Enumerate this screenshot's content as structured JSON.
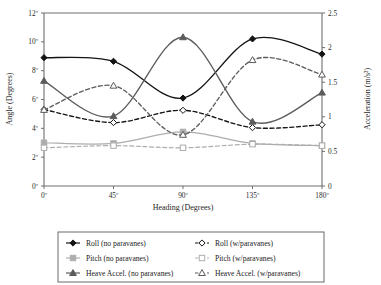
{
  "chart_data": {
    "type": "line",
    "title": "",
    "xlabel": "Heading (Degrees)",
    "ylabel": "Angle (Degrees)",
    "y2label": "Acceleration (m/s²)",
    "x": [
      0,
      45,
      90,
      135,
      180
    ],
    "xtick_labels": [
      "0º",
      "45º",
      "90º",
      "135º",
      "180º"
    ],
    "xlim": [
      0,
      180
    ],
    "ylim": [
      0,
      12
    ],
    "ytick_values": [
      0,
      2,
      4,
      6,
      8,
      10,
      12
    ],
    "ytick_labels": [
      "0º",
      "2º",
      "4º",
      "6º",
      "8º",
      "10º",
      "12º"
    ],
    "y2lim": [
      0,
      2.5
    ],
    "y2tick_values": [
      0,
      0.5,
      1,
      1.5,
      2,
      2.5
    ],
    "y2tick_labels": [
      "0",
      "0.5",
      "1",
      "1.5",
      "2",
      "2.5"
    ],
    "grid": false,
    "legend_position": "below-plot",
    "series": [
      {
        "name": "Roll (no paravanes)",
        "axis": "left",
        "units": "degrees",
        "marker": "filled-diamond",
        "line_style": "solid",
        "color": "#141414",
        "values": [
          8.9,
          8.65,
          6.1,
          10.2,
          9.15
        ]
      },
      {
        "name": "Roll (w/paravanes)",
        "axis": "left",
        "units": "degrees",
        "marker": "open-diamond",
        "line_style": "dashed",
        "color": "#141414",
        "values": [
          5.3,
          4.4,
          5.25,
          4.05,
          4.25
        ]
      },
      {
        "name": "Pitch (no paravanes)",
        "axis": "left",
        "units": "degrees",
        "marker": "filled-square",
        "line_style": "solid",
        "color": "#adadad",
        "values": [
          3.0,
          2.95,
          3.75,
          2.95,
          2.8
        ]
      },
      {
        "name": "Pitch (w/paravanes)",
        "axis": "left",
        "units": "degrees",
        "marker": "open-square",
        "line_style": "dashed",
        "color": "#adadad",
        "values": [
          2.65,
          2.8,
          2.65,
          2.9,
          2.8
        ]
      },
      {
        "name": "Heave Accel. (no paravanes)",
        "axis": "right",
        "units": "m/s^2",
        "marker": "filled-triangle",
        "line_style": "solid",
        "color": "#5c5c5c",
        "values": [
          1.52,
          1.01,
          2.15,
          0.93,
          1.35
        ]
      },
      {
        "name": "Heave Accel. (w/paravanes)",
        "axis": "right",
        "units": "m/s^2",
        "marker": "open-triangle",
        "line_style": "dashed",
        "color": "#5c5c5c",
        "values": [
          1.1,
          1.45,
          0.74,
          1.82,
          1.61
        ]
      }
    ]
  },
  "legend": {
    "entries": [
      {
        "label": "Roll (no paravanes)"
      },
      {
        "label": "Roll (w/paravanes)"
      },
      {
        "label": "Pitch (no paravanes)"
      },
      {
        "label": "Pitch (w/paravanes)"
      },
      {
        "label": "Heave Accel. (no paravanes)"
      },
      {
        "label": "Heave Accel. (w/paravanes)"
      }
    ]
  },
  "colors": {
    "dark": "#141414",
    "gray": "#adadad",
    "mid": "#5c5c5c",
    "axis": "#6e6e6e",
    "background": "#ffffff"
  }
}
